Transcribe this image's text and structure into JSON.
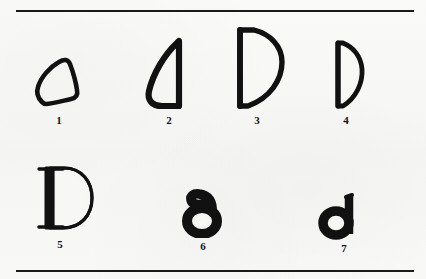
{
  "plate": {
    "background_color": "#f7f7f6",
    "ink_color": "#111111",
    "rule_color": "#1a1a1a",
    "row1_label": "",
    "row2_label": ""
  },
  "rules": {
    "top": "",
    "bottom": ""
  },
  "glyphs": [
    {
      "number": "1",
      "label": "1",
      "name": "glyph-proto-sinaitic-triangle",
      "description": "rounded triangular outline, tilted",
      "row": 1,
      "column": 1
    },
    {
      "number": "2",
      "label": "2",
      "name": "glyph-phoenician-daleth",
      "description": "thick curved left stroke with straight right stem",
      "row": 1,
      "column": 2
    },
    {
      "number": "3",
      "label": "3",
      "name": "glyph-greek-delta-open",
      "description": "large D form, straight left stem, open bowl right",
      "row": 1,
      "column": 3
    },
    {
      "number": "4",
      "label": "4",
      "name": "glyph-early-latin-d",
      "description": "narrow D form, straight left stem, tapered bowl",
      "row": 1,
      "column": 4
    },
    {
      "number": "5",
      "label": "5",
      "name": "glyph-roman-capital-d",
      "description": "classical serif capital D",
      "row": 2,
      "column": 1
    },
    {
      "number": "6",
      "label": "6",
      "name": "glyph-uncial-d",
      "description": "bold uncial d, round bowl with short leaning ascender",
      "row": 2,
      "column": 2
    },
    {
      "number": "7",
      "label": "7",
      "name": "glyph-minuscule-d",
      "description": "bold lowercase d with vertical ascender",
      "row": 2,
      "column": 3
    }
  ]
}
